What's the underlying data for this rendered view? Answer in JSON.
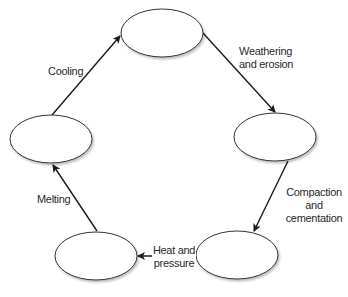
{
  "diagram": {
    "title": "",
    "nodes": [
      {
        "id": "top",
        "label": ""
      },
      {
        "id": "right",
        "label": ""
      },
      {
        "id": "bottom_right",
        "label": ""
      },
      {
        "id": "bottom_left",
        "label": ""
      },
      {
        "id": "left",
        "label": ""
      }
    ],
    "edges": [
      {
        "from": "top",
        "to": "right",
        "label_line1": "Weathering",
        "label_line2": "and erosion"
      },
      {
        "from": "right",
        "to": "bottom_right",
        "label_line1": "Compaction",
        "label_line2": "and",
        "label_line3": "cementation"
      },
      {
        "from": "bottom_right",
        "to": "bottom_left",
        "label_line1": "Heat and",
        "label_line2": "pressure"
      },
      {
        "from": "bottom_left",
        "to": "left",
        "label_line1": "Melting"
      },
      {
        "from": "left",
        "to": "top",
        "label_line1": "Cooling"
      }
    ],
    "colors": {
      "stroke": "#1a1a1a",
      "fill": "#ffffff",
      "text": "#2a2a2a"
    }
  }
}
